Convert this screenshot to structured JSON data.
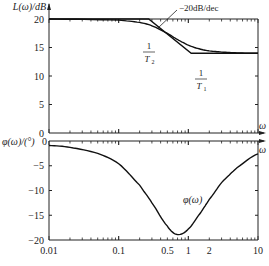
{
  "chart_data": [
    {
      "type": "line",
      "title": "",
      "xlabel": "ω",
      "ylabel": "L(ω)/dB",
      "xscale": "log",
      "xlim": [
        0.01,
        10
      ],
      "ylim": [
        0,
        20
      ],
      "yticks": [
        0,
        5,
        10,
        15,
        20
      ],
      "grid": false,
      "series": [
        {
          "name": "asymptote",
          "x": [
            0.01,
            0.27,
            1.1,
            10
          ],
          "y": [
            20,
            20,
            14,
            14
          ]
        },
        {
          "name": "exact L(ω)",
          "x": [
            0.01,
            0.1,
            0.2,
            0.3,
            0.5,
            0.7,
            1,
            1.5,
            2,
            3,
            5,
            10
          ],
          "y": [
            20,
            19.8,
            19.4,
            18.8,
            17.5,
            16.4,
            15.4,
            14.7,
            14.4,
            14.2,
            14.05,
            14
          ]
        }
      ],
      "annotations": [
        {
          "text": "−20dB/dec",
          "x": 0.4,
          "y": 19
        },
        {
          "text": "1/T2",
          "x": 0.27,
          "y": 14
        },
        {
          "text": "1/T1",
          "x": 1.1,
          "y": 8
        }
      ]
    },
    {
      "type": "line",
      "title": "",
      "xlabel": "ω",
      "ylabel": "φ(ω)/(°)",
      "xscale": "log",
      "xlim": [
        0.01,
        10
      ],
      "ylim": [
        -20,
        0
      ],
      "yticks": [
        0,
        -5,
        -10,
        -15,
        -20
      ],
      "xticks": [
        0.01,
        0.1,
        0.5,
        1,
        2,
        10
      ],
      "xticklabels": [
        "0.01",
        "0.1",
        "0.5",
        "1",
        "2",
        "10"
      ],
      "grid": false,
      "series": [
        {
          "name": "φ(ω)",
          "x": [
            0.01,
            0.02,
            0.05,
            0.1,
            0.2,
            0.3,
            0.5,
            0.7,
            1,
            1.5,
            2,
            3,
            5,
            10
          ],
          "y": [
            -0.9,
            -1.3,
            -2.5,
            -4.6,
            -8.9,
            -12.5,
            -17.2,
            -18.9,
            -17.8,
            -14.5,
            -11.8,
            -8.4,
            -5.4,
            -2.6
          ]
        }
      ],
      "annotations": [
        {
          "text": "φ(ω)",
          "x": 1.5,
          "y": -10
        }
      ]
    }
  ],
  "labels": {
    "top_ylabel": "L(ω)/dB",
    "bottom_ylabel": "φ(ω)/(°)",
    "omega": "ω",
    "slope": "−20dB/dec",
    "one": "1",
    "t2": "T",
    "t2_sub": "2",
    "t1": "T",
    "t1_sub": "1",
    "phi_curve": "φ(ω)",
    "top_yticks": [
      "20",
      "15",
      "10",
      "5",
      "0"
    ],
    "bottom_yticks": [
      "0",
      "−5",
      "−10",
      "−15",
      "−20"
    ],
    "xticks": [
      "0.01",
      "0.1",
      "0.5",
      "1",
      "2",
      "10"
    ]
  }
}
